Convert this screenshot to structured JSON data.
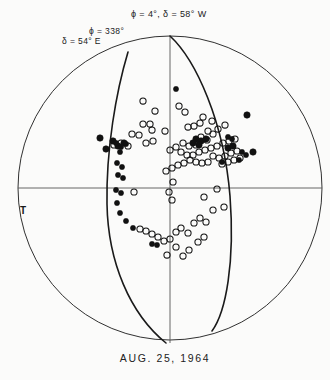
{
  "figure": {
    "caption": "AUG.  25,  1964",
    "background_color": "#fbfbfa",
    "line_color": "#1a1a1a",
    "marker_color": "#111111"
  },
  "labels": {
    "phi_top": "ϕ = 4°,  δ = 58° W",
    "phi_left": "ϕ = 338°",
    "delta_left": "δ = 54° E",
    "t_axis": "T"
  },
  "chart_data": {
    "type": "scatter",
    "projection": "stereographic",
    "xlabel": "",
    "ylabel": "",
    "grid": false,
    "legend_position": "none",
    "net": {
      "center_x": 170,
      "center_y": 188,
      "radius": 152,
      "primitive_circle_width": 0.9,
      "axis_line_width": 0.9,
      "nodal_plane_width": 1.6
    },
    "nodal_planes": [
      {
        "name": "plane-A",
        "strike_deg": 4,
        "dip_deg": 58,
        "dip_direction": "W",
        "label": "ϕ = 4°,  δ = 58° W",
        "path": "M 170 36 C 196 60 224 122 230 196 C 235 262 226 312 212 331"
      },
      {
        "name": "plane-B",
        "strike_deg": 338,
        "dip_deg": 54,
        "dip_direction": "E",
        "label": "ϕ = 338°,  δ = 54° E",
        "path": "M 128 52 C 116 92 106 150 107 204 C 108 262 130 314 166 343"
      }
    ],
    "axes": [
      {
        "name": "horizontal-axis",
        "x1": 18,
        "y1": 188,
        "x2": 322,
        "y2": 188
      },
      {
        "name": "vertical-axis",
        "x1": 170,
        "y1": 36,
        "x2": 170,
        "y2": 343
      }
    ],
    "series": [
      {
        "name": "compression-open-circle",
        "marker": "open-circle",
        "count": 74,
        "points": [
          [
            143,
            101
          ],
          [
            155,
            111
          ],
          [
            179,
            106
          ],
          [
            185,
            112
          ],
          [
            143,
            124
          ],
          [
            150,
            124
          ],
          [
            132,
            134
          ],
          [
            139,
            135
          ],
          [
            152,
            130
          ],
          [
            165,
            131
          ],
          [
            153,
            141
          ],
          [
            146,
            143
          ],
          [
            114,
            145
          ],
          [
            121,
            143
          ],
          [
            128,
            146
          ],
          [
            188,
            127
          ],
          [
            194,
            126
          ],
          [
            200,
            123
          ],
          [
            203,
            117
          ],
          [
            208,
            131
          ],
          [
            213,
            134
          ],
          [
            218,
            129
          ],
          [
            212,
            121
          ],
          [
            225,
            125
          ],
          [
            201,
            137
          ],
          [
            207,
            140
          ],
          [
            196,
            145
          ],
          [
            189,
            146
          ],
          [
            183,
            143
          ],
          [
            176,
            147
          ],
          [
            170,
            150
          ],
          [
            181,
            152
          ],
          [
            187,
            155
          ],
          [
            193,
            155
          ],
          [
            199,
            152
          ],
          [
            205,
            150
          ],
          [
            211,
            148
          ],
          [
            217,
            146
          ],
          [
            223,
            143
          ],
          [
            229,
            141
          ],
          [
            235,
            139
          ],
          [
            213,
            156
          ],
          [
            219,
            158
          ],
          [
            225,
            156
          ],
          [
            231,
            153
          ],
          [
            237,
            151
          ],
          [
            222,
            164
          ],
          [
            228,
            162
          ],
          [
            234,
            160
          ],
          [
            240,
            158
          ],
          [
            208,
            162
          ],
          [
            202,
            163
          ],
          [
            196,
            162
          ],
          [
            190,
            160
          ],
          [
            184,
            163
          ],
          [
            178,
            165
          ],
          [
            172,
            168
          ],
          [
            166,
            171
          ],
          [
            173,
            182
          ],
          [
            169,
            192
          ],
          [
            172,
            200
          ],
          [
            134,
            192
          ],
          [
            204,
            197
          ],
          [
            217,
            189
          ],
          [
            213,
            210
          ],
          [
            224,
            207
          ],
          [
            181,
            228
          ],
          [
            194,
            223
          ],
          [
            200,
            218
          ],
          [
            206,
            222
          ],
          [
            188,
            233
          ],
          [
            176,
            232
          ],
          [
            170,
            239
          ],
          [
            164,
            241
          ],
          [
            158,
            237
          ],
          [
            152,
            234
          ],
          [
            146,
            231
          ],
          [
            140,
            229
          ],
          [
            176,
            247
          ],
          [
            167,
            255
          ],
          [
            189,
            250
          ],
          [
            183,
            256
          ],
          [
            198,
            242
          ],
          [
            204,
            237
          ]
        ]
      },
      {
        "name": "dilatation-filled-circle",
        "marker": "filled-circle",
        "count": 14,
        "points": [
          [
            100,
            138
          ],
          [
            106,
            149
          ],
          [
            113,
            141
          ],
          [
            118,
            146
          ],
          [
            124,
            143
          ],
          [
            196,
            139
          ],
          [
            201,
            141
          ],
          [
            206,
            139
          ],
          [
            199,
            145
          ],
          [
            193,
            143
          ],
          [
            247,
            115
          ],
          [
            253,
            152
          ],
          [
            228,
            148
          ],
          [
            233,
            146
          ]
        ]
      },
      {
        "name": "null-star-marker",
        "marker": "star",
        "count": 18,
        "points": [
          [
            176,
            89
          ],
          [
            116,
            143
          ],
          [
            121,
            147
          ],
          [
            126,
            144
          ],
          [
            120,
            152
          ],
          [
            117,
            163
          ],
          [
            122,
            167
          ],
          [
            118,
            175
          ],
          [
            123,
            178
          ],
          [
            116,
            190
          ],
          [
            121,
            193
          ],
          [
            117,
            203
          ],
          [
            120,
            213
          ],
          [
            126,
            221
          ],
          [
            133,
            228
          ],
          [
            152,
            244
          ],
          [
            157,
            245
          ],
          [
            228,
            137
          ],
          [
            232,
            139
          ],
          [
            242,
            152
          ],
          [
            246,
            155
          ],
          [
            239,
            160
          ],
          [
            222,
            162
          ]
        ]
      }
    ]
  }
}
